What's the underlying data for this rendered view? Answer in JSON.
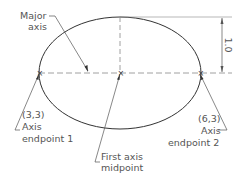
{
  "diagram": {
    "type": "ellipse-construction",
    "labels": {
      "major_axis_line1": "Major",
      "major_axis_line2": "axis",
      "endpoint1_coord": "(3,3)",
      "endpoint1_line1": "Axis",
      "endpoint1_line2": "endpoint 1",
      "endpoint2_coord": "(6,3)",
      "endpoint2_line1": "Axis",
      "endpoint2_line2": "endpoint 2",
      "midpoint_line1": "First axis",
      "midpoint_line2": "midpoint",
      "dimension": "1.0"
    },
    "colors": {
      "line": "#333333",
      "text": "#555555",
      "dashed": "#888888"
    }
  }
}
